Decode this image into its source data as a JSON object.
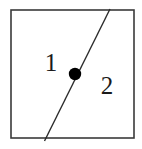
{
  "figure": {
    "background_color": "#ffffff",
    "width": 142,
    "height": 149
  },
  "square": {
    "name": "bounding-square",
    "x": 11,
    "y": 10,
    "width": 123,
    "height": 128,
    "stroke_color": "#3a3a3a",
    "stroke_width": 1.6,
    "fill_color": "#ffffff"
  },
  "diagonal_line": {
    "name": "dividing-line",
    "x1": 110,
    "y1": 9,
    "x2": 44.5,
    "y2": 141,
    "stroke_color": "#2b2b2b",
    "stroke_width": 1.4
  },
  "point": {
    "name": "center-point",
    "cx": 75,
    "cy": 74,
    "r": 6.2,
    "fill_color": "#000000"
  },
  "labels": [
    {
      "name": "region-label-1",
      "text": "1",
      "x": 51,
      "y": 71,
      "font_size": 25
    },
    {
      "name": "region-label-2",
      "text": "2",
      "x": 107,
      "y": 94,
      "font_size": 25
    }
  ]
}
